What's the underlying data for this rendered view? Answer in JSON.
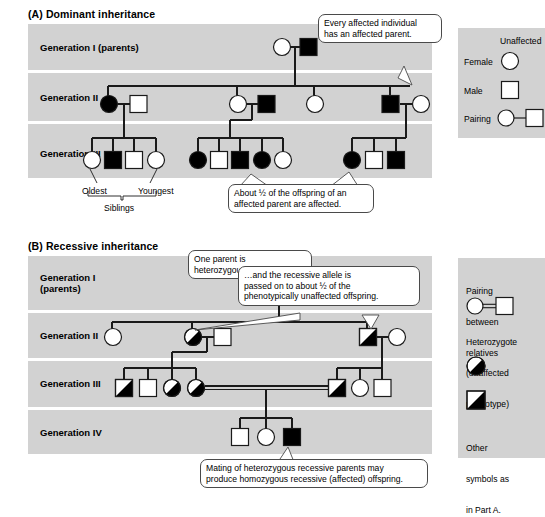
{
  "figure": {
    "panel_a": {
      "title": "(A) Dominant inheritance",
      "generations": [
        {
          "label": "Generation I (parents)"
        },
        {
          "label": "Generation II"
        },
        {
          "label": "Generation III"
        }
      ],
      "annotations": {
        "oldest": "Oldest",
        "youngest": "Youngest",
        "siblings": "Siblings"
      },
      "callouts": [
        {
          "id": "affected-parent",
          "line1": "Every affected individual",
          "line2": "has an affected parent."
        },
        {
          "id": "half-offspring",
          "line1": "About ½ of the offspring of an",
          "line2": "affected parent are affected."
        }
      ],
      "pedigree": {
        "gen1": [
          {
            "sex": "female",
            "status": "unaffected"
          },
          {
            "sex": "male",
            "status": "affected"
          }
        ],
        "gen2": [
          {
            "sex": "female",
            "status": "affected"
          },
          {
            "sex": "male",
            "status": "unaffected"
          },
          {
            "sex": "female",
            "status": "unaffected"
          },
          {
            "sex": "male",
            "status": "affected"
          },
          {
            "sex": "female",
            "status": "unaffected"
          },
          {
            "sex": "male",
            "status": "affected"
          },
          {
            "sex": "female",
            "status": "unaffected"
          }
        ],
        "gen3": [
          {
            "sex": "female",
            "status": "unaffected"
          },
          {
            "sex": "male",
            "status": "affected"
          },
          {
            "sex": "male",
            "status": "unaffected"
          },
          {
            "sex": "female",
            "status": "unaffected"
          },
          {
            "sex": "female",
            "status": "affected"
          },
          {
            "sex": "male",
            "status": "unaffected"
          },
          {
            "sex": "male",
            "status": "affected"
          },
          {
            "sex": "female",
            "status": "affected"
          },
          {
            "sex": "female",
            "status": "unaffected"
          },
          {
            "sex": "female",
            "status": "affected"
          },
          {
            "sex": "male",
            "status": "unaffected"
          },
          {
            "sex": "male",
            "status": "affected"
          }
        ]
      },
      "legend": {
        "header": "Unaffected",
        "rows": [
          {
            "label": "Female",
            "symbol": "circle-open"
          },
          {
            "label": "Male",
            "symbol": "square-open"
          },
          {
            "label": "Pairing",
            "symbol": "pairing-line"
          }
        ]
      }
    },
    "panel_b": {
      "title": "(B) Recessive inheritance",
      "generations": [
        {
          "label": "Generation I",
          "sublabel": "(parents)"
        },
        {
          "label": "Generation II"
        },
        {
          "label": "Generation III"
        },
        {
          "label": "Generation IV"
        }
      ],
      "callouts": [
        {
          "id": "one-parent-het",
          "line1": "One parent is heterozygous…"
        },
        {
          "id": "recessive-allele",
          "line1": "…and the recessive allele is",
          "line2": "passed on to about ½ of the",
          "line3": "phenotypically unaffected offspring."
        },
        {
          "id": "mating-het",
          "line1": "Mating of heterozygous recessive parents may",
          "line2": "produce homozygous recessive (affected) offspring."
        }
      ],
      "pedigree": {
        "gen1": [
          {
            "sex": "female",
            "status": "heterozygote"
          },
          {
            "sex": "male",
            "status": "unaffected"
          }
        ],
        "gen2": [
          {
            "sex": "female",
            "status": "unaffected"
          },
          {
            "sex": "female",
            "status": "heterozygote"
          },
          {
            "sex": "male",
            "status": "unaffected"
          },
          {
            "sex": "male",
            "status": "heterozygote"
          },
          {
            "sex": "female",
            "status": "unaffected"
          }
        ],
        "gen3": [
          {
            "sex": "male",
            "status": "heterozygote"
          },
          {
            "sex": "male",
            "status": "unaffected"
          },
          {
            "sex": "female",
            "status": "heterozygote"
          },
          {
            "sex": "female",
            "status": "heterozygote"
          },
          {
            "sex": "male",
            "status": "heterozygote"
          },
          {
            "sex": "female",
            "status": "unaffected"
          },
          {
            "sex": "male",
            "status": "unaffected"
          }
        ],
        "gen4": [
          {
            "sex": "male",
            "status": "unaffected"
          },
          {
            "sex": "female",
            "status": "unaffected"
          },
          {
            "sex": "male",
            "status": "affected"
          }
        ]
      },
      "legend": {
        "pairing_title_line1": "Pairing",
        "pairing_title_line2": "between",
        "pairing_title_line3": "relatives",
        "het_title_line1": "Heterozygote",
        "het_title_line2": "(unaffected",
        "het_title_line3": "phenotype)",
        "other_line1": "Other",
        "other_line2": "symbols as",
        "other_line3": "in Part A."
      }
    },
    "colors": {
      "band": "#d2d2d2",
      "affected": "#000000",
      "unaffected": "#ffffff",
      "stroke": "#1a1a1a",
      "callout_border": "#4a4a4a",
      "page": "#ffffff"
    }
  }
}
